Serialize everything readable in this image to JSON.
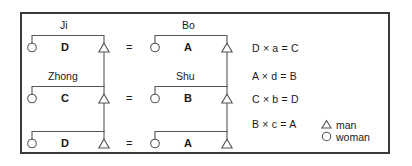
{
  "figure": {
    "frame_color": "#3a3a3a",
    "line_color": "#555555",
    "text_color": "#1a1a1a"
  },
  "rows": [
    {
      "left": {
        "name": "Ji",
        "relation": "D",
        "woman": "woman-symbol",
        "man": "man-symbol"
      },
      "equals": "=",
      "right": {
        "name": "Bo",
        "relation": "A",
        "woman": "woman-symbol",
        "man": "man-symbol"
      }
    },
    {
      "left": {
        "name": "Zhong",
        "relation": "C",
        "woman": "woman-symbol",
        "man": "man-symbol"
      },
      "equals": "=",
      "right": {
        "name": "Shu",
        "relation": "B",
        "woman": "woman-symbol",
        "man": "man-symbol"
      }
    },
    {
      "left": {
        "name": "",
        "relation": "D",
        "woman": "woman-symbol",
        "man": "man-symbol"
      },
      "equals": "=",
      "right": {
        "name": "",
        "relation": "A",
        "woman": "woman-symbol",
        "man": "man-symbol"
      }
    }
  ],
  "equations": [
    "D × a = C",
    "A × d = B",
    "C × b = D",
    "B × c = A"
  ],
  "legend": [
    {
      "symbol": "triangle-icon",
      "label": "man"
    },
    {
      "symbol": "circle-icon",
      "label": "woman"
    }
  ]
}
